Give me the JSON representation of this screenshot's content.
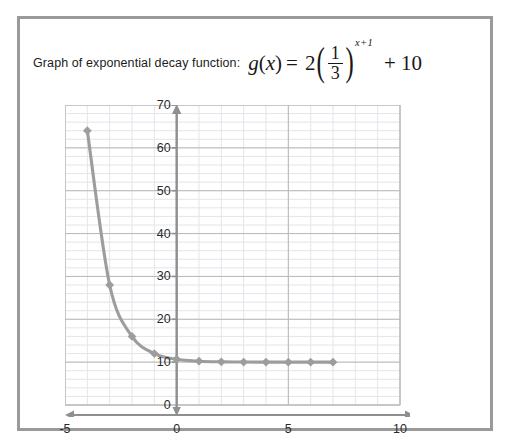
{
  "caption": {
    "text": "Graph of exponential decay function:",
    "formula": {
      "function_name": "g",
      "variable": "x",
      "equals": "=",
      "coefficient": "2",
      "fraction_numerator": "1",
      "fraction_denominator": "3",
      "exponent": "x+1",
      "plus_constant": "+ 10",
      "plain": "g(x) = 2(1/3)^(x+1) + 10"
    }
  },
  "colors": {
    "frame": "#9a9a9a",
    "axis": "#8f8f8f",
    "curve": "#9d9d9d",
    "marker": "#9d9d9d",
    "grid_major": "#b9b9b9",
    "grid_minor": "#e4e4ea",
    "text": "#2a2a2a"
  },
  "chart_data": {
    "type": "line",
    "xlabel": "",
    "ylabel": "",
    "xlim": [
      -5,
      10
    ],
    "ylim": [
      0,
      70
    ],
    "xticks": [
      -5,
      0,
      5,
      10
    ],
    "xtick_labels": [
      "-5",
      "0",
      "5",
      "10"
    ],
    "yticks": [
      0,
      10,
      20,
      30,
      40,
      50,
      60,
      70
    ],
    "ytick_labels": [
      "0",
      "10",
      "20",
      "30",
      "40",
      "50",
      "60",
      "70"
    ],
    "grid": true,
    "grid_minor_x_step": 1,
    "grid_minor_y_step": 2,
    "grid_major_x_step": 5,
    "grid_major_y_step": 10,
    "legend": false,
    "markers": "diamond",
    "x": [
      -4,
      -3,
      -2,
      -1,
      0,
      1,
      2,
      3,
      4,
      5,
      6,
      7
    ],
    "values": [
      64,
      28,
      16,
      12,
      10.67,
      10.22,
      10.07,
      10.02,
      10.01,
      10,
      10,
      10
    ],
    "series": [
      {
        "name": "g(x) = 2(1/3)^(x+1) + 10",
        "values": [
          64,
          28,
          16,
          12,
          10.67,
          10.22,
          10.07,
          10.02,
          10.01,
          10,
          10,
          10
        ]
      }
    ]
  }
}
